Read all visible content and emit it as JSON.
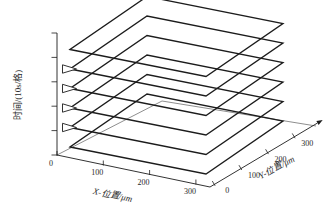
{
  "chart_data": {
    "type": "line",
    "subtype": "3d-wireframe-stacked-rectangular-loops",
    "title": "",
    "background_color": "#ffffff",
    "line_color": "#1c1c1c",
    "grid": false,
    "legend": null,
    "axes": {
      "x": {
        "label": "X-位置/μm",
        "tick_labels": [
          "0",
          "100",
          "200",
          "300"
        ],
        "range": [
          0,
          300
        ]
      },
      "y": {
        "label": "Y-位置/μm",
        "tick_labels": [
          "0",
          "100",
          "200",
          "300"
        ],
        "range": [
          0,
          300
        ]
      },
      "z": {
        "label": "时间/(10s/格)",
        "tick_count": 6,
        "division_unit": "10s/格"
      }
    },
    "loops": [
      {
        "level": 1,
        "x_extent": [
          0,
          300
        ],
        "y_extent": [
          0,
          300
        ],
        "start_marker": false
      },
      {
        "level": 2,
        "x_extent": [
          0,
          300
        ],
        "y_extent": [
          0,
          300
        ],
        "start_marker": true
      },
      {
        "level": 3,
        "x_extent": [
          0,
          300
        ],
        "y_extent": [
          0,
          300
        ],
        "start_marker": true
      },
      {
        "level": 4,
        "x_extent": [
          0,
          300
        ],
        "y_extent": [
          0,
          300
        ],
        "start_marker": true
      },
      {
        "level": 5,
        "x_extent": [
          0,
          300
        ],
        "y_extent": [
          0,
          300
        ],
        "start_marker": true
      },
      {
        "level": 6,
        "x_extent": [
          0,
          300
        ],
        "y_extent": [
          0,
          300
        ],
        "start_marker": false
      }
    ],
    "marker_style": "hollow-right-pointing-triangle"
  }
}
